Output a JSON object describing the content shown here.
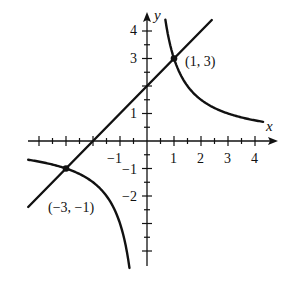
{
  "chart_data": {
    "type": "line",
    "title": "",
    "xlabel": "x",
    "ylabel": "y",
    "xlim": [
      -4.4,
      4.6
    ],
    "ylim": [
      -4.6,
      4.6
    ],
    "grid": false,
    "x_ticks": [
      -4,
      -3,
      -2,
      -1,
      1,
      2,
      3,
      4
    ],
    "x_tick_labels": [
      "-1",
      "1",
      "2",
      "3",
      "4"
    ],
    "x_tick_labels_values": [
      -1,
      1,
      2,
      3,
      4
    ],
    "y_ticks": [
      -4,
      -3,
      -2,
      -1,
      1,
      2,
      3,
      4
    ],
    "y_tick_labels": [
      "4",
      "3",
      "1",
      "-1",
      "-2"
    ],
    "y_tick_labels_values": [
      4,
      3,
      1,
      -1,
      -2
    ],
    "minor_tick_step": 0.5,
    "series": [
      {
        "name": "line",
        "equation": "y = x + 2",
        "x_range": [
          -4.4,
          2.4
        ]
      },
      {
        "name": "hyperbola-right",
        "equation": "y = 3/x",
        "x_range": [
          0.68,
          4.3
        ]
      },
      {
        "name": "hyperbola-left",
        "equation": "y = 3/x",
        "x_range": [
          -4.4,
          -0.65
        ]
      }
    ],
    "points": [
      {
        "x": 1,
        "y": 3,
        "label": "(1, 3)"
      },
      {
        "x": -3,
        "y": -1,
        "label": "(−3, −1)"
      }
    ]
  },
  "labels": {
    "x_axis": "x",
    "y_axis": "y",
    "point_a": "(1, 3)",
    "point_b": "(−3, −1)",
    "xt_m1": "−1",
    "xt_1": "1",
    "xt_2": "2",
    "xt_3": "3",
    "xt_4": "4",
    "yt_4": "4",
    "yt_3": "3",
    "yt_1": "1",
    "yt_m1": "−1",
    "yt_m2": "−2"
  }
}
